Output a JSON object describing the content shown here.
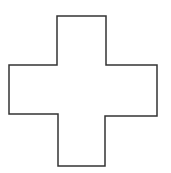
{
  "canvas": {
    "width": 171,
    "height": 173,
    "background": "#ffffff"
  },
  "shape": {
    "type": "cross-outline",
    "stroke": "#333333",
    "stroke_width": 1.5,
    "fill": "#ffffff",
    "points": "57,16 106,16 106,65 157,65 157,116 105,116 105,166 58,166 58,114 9,114 9,65 57,65"
  }
}
